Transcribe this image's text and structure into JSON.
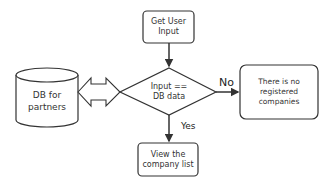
{
  "diagram": {
    "type": "flowchart",
    "nodes": {
      "get_input": {
        "label": "Get User\nInput",
        "shape": "rounded-rect"
      },
      "database": {
        "label": "DB for\npartners",
        "shape": "cylinder"
      },
      "decision": {
        "label": "Input ==\nDB data",
        "shape": "diamond"
      },
      "no_result": {
        "label": "There is no\nregistered\ncompanies",
        "shape": "rounded-rect"
      },
      "view_list": {
        "label": "View the\ncompany list",
        "shape": "rounded-rect"
      }
    },
    "edges": {
      "no_label": "No",
      "yes_label": "Yes"
    },
    "colors": {
      "stroke": "#333333",
      "fill": "#ffffff",
      "text": "#333333"
    }
  }
}
